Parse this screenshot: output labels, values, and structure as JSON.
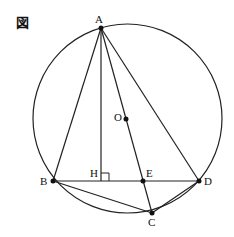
{
  "figure_label": "図",
  "circle": {
    "cx": 127.5,
    "cy": 118.5,
    "r": 94.5
  },
  "points": {
    "A": {
      "label": "A",
      "x": 101,
      "y": 28,
      "lx": 95,
      "ly": 23
    },
    "B": {
      "label": "B",
      "x": 53,
      "y": 181,
      "lx": 40,
      "ly": 185
    },
    "C": {
      "label": "C",
      "x": 152,
      "y": 213,
      "lx": 148,
      "ly": 226
    },
    "D": {
      "label": "D",
      "x": 199,
      "y": 181,
      "lx": 204,
      "ly": 185
    },
    "E": {
      "label": "E",
      "x": 143,
      "y": 181,
      "lx": 146,
      "ly": 177
    },
    "H": {
      "label": "H",
      "x": 101,
      "y": 181,
      "lx": 90,
      "ly": 177
    },
    "O": {
      "label": "O",
      "x": 126,
      "y": 119,
      "lx": 114,
      "ly": 121
    }
  },
  "segments": [
    "AB",
    "AD",
    "AH",
    "AC",
    "BD",
    "BC",
    "CD"
  ],
  "right_angle_at": "H",
  "colors": {
    "stroke": "#222222",
    "background": "#ffffff"
  }
}
